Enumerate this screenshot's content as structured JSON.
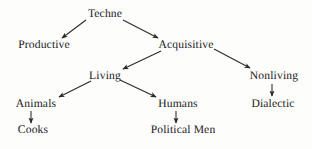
{
  "diagram": {
    "background_color": "#fdfdfb",
    "text_color": "#20201e",
    "edge_color": "#2a2a28",
    "nodes": [
      {
        "id": "techne",
        "label": "Techne",
        "x": 105,
        "y": 14
      },
      {
        "id": "productive",
        "label": "Productive",
        "x": 44,
        "y": 45
      },
      {
        "id": "acquisitive",
        "label": "Acquisitive",
        "x": 186,
        "y": 45
      },
      {
        "id": "living",
        "label": "Living",
        "x": 105,
        "y": 76
      },
      {
        "id": "nonliving",
        "label": "Nonliving",
        "x": 274,
        "y": 76
      },
      {
        "id": "animals",
        "label": "Animals",
        "x": 36,
        "y": 104
      },
      {
        "id": "humans",
        "label": "Humans",
        "x": 178,
        "y": 104
      },
      {
        "id": "dialectic",
        "label": "Dialectic",
        "x": 273,
        "y": 104
      },
      {
        "id": "cooks",
        "label": "Cooks",
        "x": 33,
        "y": 130
      },
      {
        "id": "political_men",
        "label": "Political Men",
        "x": 183,
        "y": 130
      }
    ],
    "edges": [
      {
        "id": "techne-productive",
        "from": "techne",
        "to": "productive",
        "x1": 86,
        "y1": 20,
        "x2": 62,
        "y2": 38
      },
      {
        "id": "techne-acquisitive",
        "from": "techne",
        "to": "acquisitive",
        "x1": 123,
        "y1": 20,
        "x2": 158,
        "y2": 38
      },
      {
        "id": "acquisitive-living",
        "from": "acquisitive",
        "to": "living",
        "x1": 161,
        "y1": 51,
        "x2": 123,
        "y2": 69
      },
      {
        "id": "acquisitive-nonliving",
        "from": "acquisitive",
        "to": "nonliving",
        "x1": 214,
        "y1": 49,
        "x2": 250,
        "y2": 68
      },
      {
        "id": "living-animals",
        "from": "living",
        "to": "animals",
        "x1": 91,
        "y1": 81,
        "x2": 59,
        "y2": 97
      },
      {
        "id": "living-humans",
        "from": "living",
        "to": "humans",
        "x1": 120,
        "y1": 80,
        "x2": 156,
        "y2": 97
      },
      {
        "id": "animals-cooks",
        "from": "animals",
        "to": "cooks",
        "x1": 31,
        "y1": 111,
        "x2": 31,
        "y2": 123
      },
      {
        "id": "humans-political-men",
        "from": "humans",
        "to": "political_men",
        "x1": 176,
        "y1": 111,
        "x2": 176,
        "y2": 123
      },
      {
        "id": "nonliving-dialectic",
        "from": "nonliving",
        "to": "dialectic",
        "x1": 272,
        "y1": 84,
        "x2": 272,
        "y2": 96
      }
    ]
  }
}
